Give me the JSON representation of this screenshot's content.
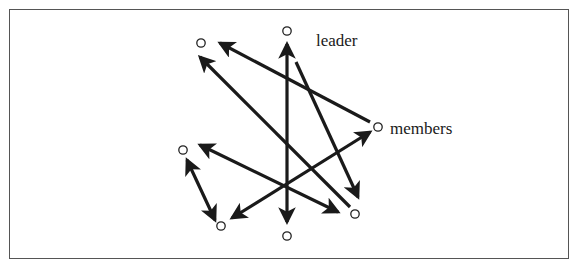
{
  "diagram": {
    "labels": {
      "leader": "leader",
      "members": "members"
    },
    "colors": {
      "stroke": "#1a1a1a",
      "node": "#222222",
      "frame": "#555555",
      "background": "#ffffff"
    },
    "nodes": [
      {
        "id": "n1",
        "x": 201,
        "y": 43,
        "role": "member"
      },
      {
        "id": "n2",
        "x": 287,
        "y": 31,
        "role": "leader"
      },
      {
        "id": "n3",
        "x": 378,
        "y": 127,
        "role": "member"
      },
      {
        "id": "n4",
        "x": 183,
        "y": 150,
        "role": "member"
      },
      {
        "id": "n5",
        "x": 221,
        "y": 226,
        "role": "member"
      },
      {
        "id": "n6",
        "x": 287,
        "y": 236,
        "role": "member"
      },
      {
        "id": "n7",
        "x": 355,
        "y": 214,
        "role": "member"
      }
    ],
    "edges": [
      {
        "from": [
          370,
          122
        ],
        "to": [
          220,
          43
        ],
        "heads": "end"
      },
      {
        "from": [
          350,
          207
        ],
        "to": [
          200,
          57
        ],
        "heads": "end"
      },
      {
        "from": [
          287,
          222
        ],
        "to": [
          287,
          44
        ],
        "heads": "both"
      },
      {
        "from": [
          296,
          62
        ],
        "to": [
          358,
          197
        ],
        "heads": "end"
      },
      {
        "from": [
          200,
          145
        ],
        "to": [
          338,
          212
        ],
        "heads": "both"
      },
      {
        "from": [
          187,
          160
        ],
        "to": [
          215,
          220
        ],
        "heads": "both"
      },
      {
        "from": [
          232,
          218
        ],
        "to": [
          370,
          132
        ],
        "heads": "both"
      }
    ]
  }
}
